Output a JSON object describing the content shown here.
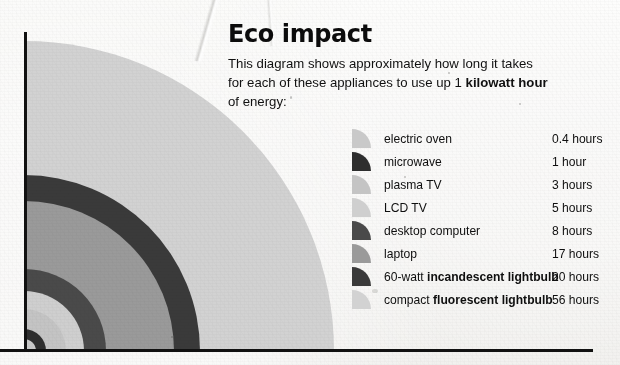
{
  "page": {
    "background_color": "#f2f1ef",
    "axis_color": "#111111"
  },
  "header": {
    "title": "Eco impact",
    "description_line1": "This diagram shows approximately how long it takes",
    "description_line2_pre": "for each of these appliances to use up 1 ",
    "description_line2_bold": "kilowatt hour",
    "description_line3": "of energy:"
  },
  "legend": {
    "items": [
      {
        "name": "electric oven",
        "name_pre": "electric oven",
        "name_bold": "",
        "hours": "0.4 hours",
        "color": "#c9c9c9",
        "swatch": "quarter-circle-swatch"
      },
      {
        "name": "microwave",
        "name_pre": "microwave",
        "name_bold": "",
        "hours": "1 hour",
        "color": "#2e2e2e",
        "swatch": "quarter-circle-swatch"
      },
      {
        "name": "plasma TV",
        "name_pre": "plasma TV",
        "name_bold": "",
        "hours": "3 hours",
        "color": "#c4c4c4",
        "swatch": "quarter-circle-swatch"
      },
      {
        "name": "LCD TV",
        "name_pre": "LCD TV",
        "name_bold": "",
        "hours": "5 hours",
        "color": "#cfcfcf",
        "swatch": "quarter-circle-swatch"
      },
      {
        "name": "desktop computer",
        "name_pre": "desktop computer",
        "name_bold": "",
        "hours": "8 hours",
        "color": "#4a4a4a",
        "swatch": "quarter-circle-swatch"
      },
      {
        "name": "laptop",
        "name_pre": "laptop",
        "name_bold": "",
        "hours": "17 hours",
        "color": "#9a9a9a",
        "swatch": "quarter-circle-swatch"
      },
      {
        "name": "60-watt incandescent lightbulb",
        "name_pre": "60-watt ",
        "name_bold": "incandescent lightbulb",
        "hours": "20 hours",
        "color": "#3a3a3a",
        "swatch": "quarter-circle-swatch"
      },
      {
        "name": "compact fluorescent lightbulb",
        "name_pre": "compact ",
        "name_bold": "fluorescent lightbulb",
        "hours": "56 hours",
        "color": "#d2d2d2",
        "swatch": "quarter-circle-swatch"
      }
    ]
  },
  "chart_data": {
    "type": "pie",
    "title": "Eco impact",
    "subtitle": "This diagram shows approximately how long it takes for each of these appliances to use up 1 kilowatt hour of energy:",
    "xlabel": "",
    "ylabel": "",
    "grid": false,
    "legend_position": "right",
    "note": "Concentric quarter-circle bands; band radius is proportional to the hours needed to consume 1 kWh. Origin at bottom-left of the two black axis lines.",
    "units": "hours",
    "categories": [
      "electric oven",
      "microwave",
      "plasma TV",
      "LCD TV",
      "desktop computer",
      "laptop",
      "60-watt incandescent lightbulb",
      "compact fluorescent lightbulb"
    ],
    "values": [
      0.4,
      1,
      3,
      5,
      8,
      17,
      20,
      56
    ],
    "value_labels": [
      "0.4 hours",
      "1 hour",
      "3 hours",
      "5 hours",
      "8 hours",
      "17 hours",
      "20 hours",
      "56 hours"
    ],
    "colors": [
      "#c9c9c9",
      "#2e2e2e",
      "#c4c4c4",
      "#cfcfcf",
      "#4a4a4a",
      "#9a9a9a",
      "#3a3a3a",
      "#d2d2d2"
    ],
    "arc_radii_px": [
      12,
      22,
      42,
      60,
      82,
      150,
      176,
      310
    ],
    "origin_px": [
      24,
      351
    ]
  }
}
